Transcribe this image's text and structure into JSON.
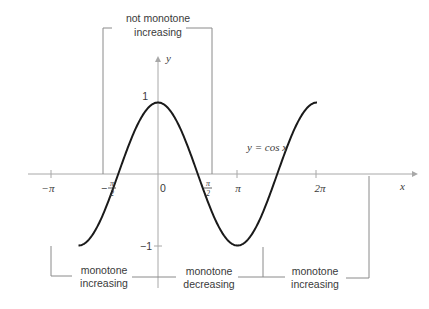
{
  "diagram": {
    "type": "function-graph",
    "function_label": "y = cos x",
    "axes": {
      "x_label": "x",
      "y_label": "y",
      "x_ticks": [
        "−π",
        "−π/2",
        "0",
        "π/2",
        "π",
        "2π"
      ],
      "y_ticks": [
        "1",
        "−1"
      ]
    },
    "annotations": {
      "top_bracket": {
        "line1": "not monotone",
        "line2": "increasing",
        "interval": "[−π/2, π/2]"
      },
      "bottom_brackets": [
        {
          "line1": "monotone",
          "line2": "increasing",
          "interval": "[−π, 0]"
        },
        {
          "line1": "monotone",
          "line2": "decreasing",
          "interval": "[0, π]"
        },
        {
          "line1": "monotone",
          "line2": "increasing",
          "interval": "[π, 2π]"
        }
      ]
    },
    "colors": {
      "curve": "#1a1a1a",
      "axes": "#a8a8a8",
      "brackets": "#8a8a8a",
      "text": "#3a3a3a"
    }
  }
}
